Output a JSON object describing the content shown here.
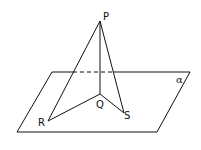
{
  "diagram": {
    "labels": {
      "P": "P",
      "Q": "Q",
      "R": "R",
      "S": "S",
      "plane": "α"
    },
    "points": {
      "P": [
        100,
        21
      ],
      "Q": [
        100,
        94
      ],
      "R": [
        48,
        121
      ],
      "S": [
        124,
        113
      ]
    },
    "plane_corners": [
      [
        52,
        72
      ],
      [
        190,
        72
      ],
      [
        157,
        132
      ],
      [
        17,
        132
      ]
    ],
    "stroke_color": "#111111"
  }
}
